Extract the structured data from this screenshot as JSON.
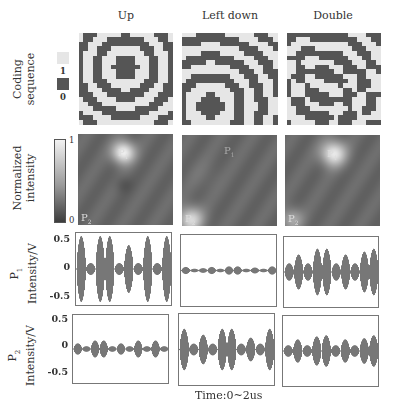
{
  "columns": [
    {
      "label": "Up"
    },
    {
      "label": "Left down"
    },
    {
      "label": "Double"
    }
  ],
  "rows": {
    "coding": {
      "label_line1": "Coding",
      "label_line2": "sequence"
    },
    "intensity": {
      "label_line1": "Normalized",
      "label_line2": "intensity"
    },
    "p1": {
      "label_line1": "P",
      "label_sub": "1",
      "label_line2": "Intensity/V"
    },
    "p2": {
      "label_line1": "P",
      "label_sub": "2",
      "label_line2": "Intensity/V"
    }
  },
  "legend": {
    "coding": [
      {
        "value": "1",
        "color": "#e6e6e6"
      },
      {
        "value": "0",
        "color": "#555555"
      }
    ],
    "colorbar": {
      "max": "1",
      "min": "0"
    }
  },
  "axis": {
    "y_ticks": [
      "0.5",
      "0",
      "-0.5"
    ],
    "x_label": "Time:0~2us"
  },
  "heatmap_points": {
    "p1": "P",
    "p1_sub": "1",
    "p2": "P",
    "p2_sub": "2"
  },
  "colors": {
    "code_one": "#e6e6e6",
    "code_zero": "#555555",
    "waveform": "#777777",
    "heat_bg": "#4a4a4a"
  },
  "chart_data": {
    "type": "line",
    "title": "",
    "xlabel": "Time:0~2us",
    "ylabel": "Intensity/V",
    "ylim": [
      -0.6,
      0.6
    ],
    "yticks": [
      0.5,
      0,
      -0.5
    ],
    "panels": [
      {
        "row": "P1",
        "column": "Up",
        "envelope_peak": 0.55,
        "pattern": "large bursts alternating with small",
        "bursts": [
          0.55,
          0.1,
          0.55,
          0.55,
          0.1,
          0.4,
          0.1,
          0.55,
          0.1,
          0.55
        ]
      },
      {
        "row": "P1",
        "column": "Left down",
        "envelope_peak": 0.08,
        "pattern": "small near-zero bursts",
        "bursts": [
          0.06,
          0.03,
          0.04,
          0.06,
          0.03,
          0.07,
          0.07,
          0.03,
          0.05,
          0.03,
          0.07
        ]
      },
      {
        "row": "P1",
        "column": "Double",
        "envelope_peak": 0.4,
        "pattern": "medium bursts",
        "bursts": [
          0.15,
          0.3,
          0.15,
          0.4,
          0.4,
          0.15,
          0.3,
          0.15,
          0.35,
          0.4
        ]
      },
      {
        "row": "P2",
        "column": "Up",
        "envelope_peak": 0.15,
        "pattern": "small bursts",
        "bursts": [
          0.1,
          0.05,
          0.15,
          0.15,
          0.05,
          0.1,
          0.05,
          0.15,
          0.05,
          0.15,
          0.05
        ]
      },
      {
        "row": "P2",
        "column": "Left down",
        "envelope_peak": 0.35,
        "pattern": "medium-large bursts",
        "bursts": [
          0.35,
          0.1,
          0.25,
          0.1,
          0.35,
          0.35,
          0.1,
          0.2,
          0.1,
          0.35
        ]
      },
      {
        "row": "P2",
        "column": "Double",
        "envelope_peak": 0.27,
        "pattern": "medium bursts",
        "bursts": [
          0.1,
          0.2,
          0.1,
          0.25,
          0.27,
          0.1,
          0.2,
          0.1,
          0.22,
          0.27
        ]
      }
    ],
    "heatmaps": [
      {
        "column": "Up",
        "bright_spot": "P1 (top-center)",
        "dim_spot": "P2 (bottom-left)"
      },
      {
        "column": "Left down",
        "bright_spot": "P2 (bottom-left)",
        "dim_spot": "P1 (top-center)"
      },
      {
        "column": "Double",
        "bright_spot": "P1 (top-center) and P2 (bottom-left)",
        "dim_spot": ""
      }
    ],
    "coding_patterns": [
      {
        "column": "Up",
        "focus": [
          0.5,
          0.3
        ],
        "pattern": "concentric rings centered upper-middle"
      },
      {
        "column": "Left down",
        "focus": [
          0.2,
          0.85
        ],
        "pattern": "concentric rings centered lower-left"
      },
      {
        "column": "Double",
        "focus": "superposition",
        "pattern": "mixed ring pattern"
      }
    ]
  }
}
